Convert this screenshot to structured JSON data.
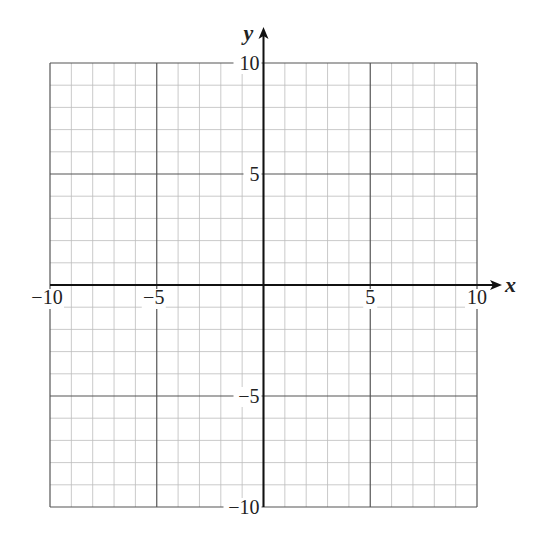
{
  "chart_data": {
    "type": "line",
    "title": "",
    "xlabel": "x",
    "ylabel": "y",
    "xlim": [
      -10,
      10
    ],
    "ylim": [
      -10,
      10
    ],
    "grid": true,
    "grid_minor_step": 1,
    "grid_major_step": 5,
    "x_ticks": [
      -10,
      -5,
      5,
      10
    ],
    "y_ticks": [
      10,
      5,
      -5,
      -10
    ],
    "x_tick_labels": [
      "−10",
      "−5",
      "5",
      "10"
    ],
    "y_tick_labels": [
      "10",
      "5",
      "−5",
      "−10"
    ],
    "series": [],
    "legend": null
  },
  "colors": {
    "minor_grid": "#bdbdbd",
    "major_grid": "#555555",
    "axis": "#111111"
  },
  "layout": {
    "left": 50,
    "right": 477,
    "top": 63,
    "bottom": 507
  }
}
